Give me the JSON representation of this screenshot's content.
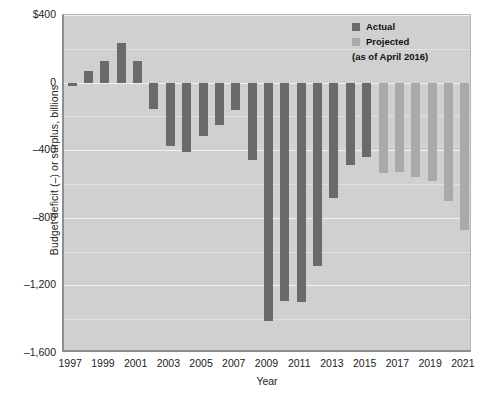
{
  "chart_data": {
    "type": "bar",
    "title": "",
    "xlabel": "Year",
    "ylabel": "Budget deficit (–) or surplus, billions",
    "ylim": [
      -1600,
      400
    ],
    "yticks": [
      400,
      0,
      -400,
      -800,
      -1200,
      -1600
    ],
    "ytick_labels": [
      "$400",
      "0",
      "–400",
      "–800",
      "–1,200",
      "–1,600"
    ],
    "grid": true,
    "legend_position": "top-right",
    "legend": [
      {
        "label": "Actual",
        "color": "#6a6a6a"
      },
      {
        "label": "Projected",
        "color": "#a9aaa9"
      }
    ],
    "legend_note": "(as of April 2016)",
    "xtick_labels": [
      "1997",
      "1999",
      "2001",
      "2003",
      "2005",
      "2007",
      "2009",
      "2011",
      "2013",
      "2015",
      "2017",
      "2019",
      "2021"
    ],
    "categories": [
      "1997",
      "1998",
      "1999",
      "2000",
      "2001",
      "2002",
      "2003",
      "2004",
      "2005",
      "2006",
      "2007",
      "2008",
      "2009",
      "2010",
      "2011",
      "2012",
      "2013",
      "2014",
      "2015",
      "2016",
      "2017",
      "2018",
      "2019",
      "2020",
      "2021"
    ],
    "values": [
      -22,
      69,
      126,
      236,
      128,
      -158,
      -378,
      -413,
      -318,
      -248,
      -161,
      -459,
      -1413,
      -1294,
      -1300,
      -1087,
      -680,
      -485,
      -438,
      -534,
      -530,
      -560,
      -580,
      -700,
      -870
    ],
    "series_kind": [
      "actual",
      "actual",
      "actual",
      "actual",
      "actual",
      "actual",
      "actual",
      "actual",
      "actual",
      "actual",
      "actual",
      "actual",
      "actual",
      "actual",
      "actual",
      "actual",
      "actual",
      "actual",
      "actual",
      "projected",
      "projected",
      "projected",
      "projected",
      "projected",
      "projected"
    ]
  }
}
